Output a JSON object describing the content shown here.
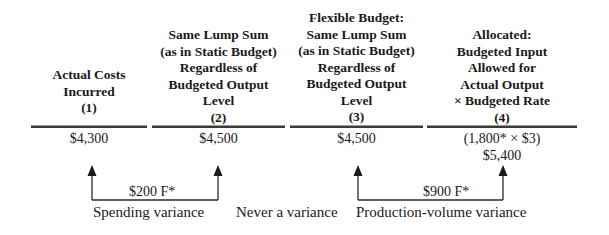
{
  "columns": [
    {
      "heading_lines": [
        "Actual Costs",
        "Incurred",
        "(1)"
      ],
      "amount_lines": [
        "$4,300"
      ]
    },
    {
      "heading_lines": [
        "Same Lump Sum",
        "(as in Static Budget)",
        "Regardless of",
        "Budgeted Output",
        "Level",
        "(2)"
      ],
      "amount_lines": [
        "$4,500"
      ]
    },
    {
      "heading_lines": [
        "Flexible Budget:",
        "Same Lump Sum",
        "(as in Static Budget)",
        "Regardless of",
        "Budgeted Output",
        "Level",
        "(3)"
      ],
      "amount_lines": [
        "$4,500"
      ]
    },
    {
      "heading_lines": [
        "Allocated:",
        "Budgeted Input",
        "Allowed for",
        "Actual Output",
        "× Budgeted Rate",
        "(4)"
      ],
      "amount_lines": [
        "(1,800* × $3)",
        "$5,400"
      ]
    }
  ],
  "variances": [
    {
      "amount": "$200 F*",
      "label": "Spending variance",
      "from_column": 1,
      "to_column": 2
    },
    {
      "amount": "",
      "label": "Never a variance",
      "from_column": 2,
      "to_column": 3
    },
    {
      "amount": "$900 F*",
      "label": "Production-volume variance",
      "from_column": 3,
      "to_column": 4
    }
  ],
  "colors": {
    "ink": "#1a1a1a",
    "rule": "#3a3a3a"
  }
}
